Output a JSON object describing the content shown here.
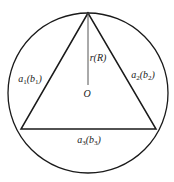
{
  "diagram": {
    "colors": {
      "stroke": "#1a1a1a",
      "radius_line": "#555555",
      "background": "#ffffff"
    },
    "circle": {
      "cx": 88,
      "cy": 93,
      "r": 80
    },
    "triangle": {
      "apex": [
        88,
        13
      ],
      "bottom_left": [
        21,
        129
      ],
      "bottom_right": [
        156,
        129
      ]
    },
    "radius_line": {
      "from": [
        88,
        13
      ],
      "to": [
        88,
        85
      ]
    },
    "labels": {
      "radius": {
        "base": "r(R)",
        "x": 98,
        "y": 58
      },
      "center": {
        "base": "O",
        "x": 87,
        "y": 94
      },
      "side_left": {
        "base": "a",
        "sub": "1",
        "paren": "b",
        "paren_sub": "1",
        "x": 30,
        "y": 80
      },
      "side_right": {
        "base": "a",
        "sub": "2",
        "paren": "b",
        "paren_sub": "2",
        "x": 143,
        "y": 76
      },
      "side_bottom": {
        "base": "a",
        "sub": "3",
        "paren": "b",
        "paren_sub": "3",
        "x": 89,
        "y": 141
      }
    }
  }
}
